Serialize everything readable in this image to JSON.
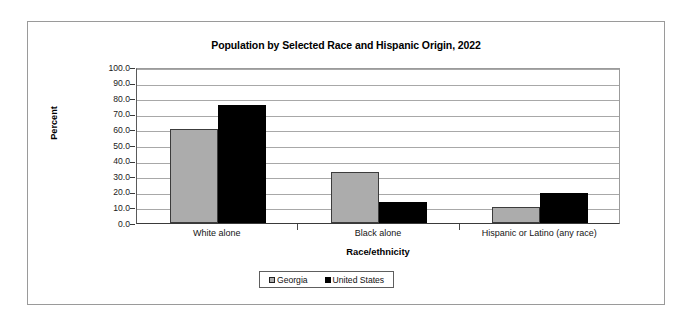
{
  "chart_data": {
    "type": "bar",
    "title": "Population by Selected Race and Hispanic Origin, 2022",
    "xlabel": "Race/ethnicity",
    "ylabel": "Percent",
    "categories": [
      "White alone",
      "Black alone",
      "Hispanic or Latino (any race)"
    ],
    "series": [
      {
        "name": "Georgia",
        "color": "#acacac",
        "values": [
          60.5,
          33.0,
          10.5
        ]
      },
      {
        "name": "United States",
        "color": "#000000",
        "values": [
          75.5,
          13.6,
          19.1
        ]
      }
    ],
    "ylim": [
      0,
      100
    ],
    "ytick_labels": [
      "100.0",
      "90.0",
      "80.0",
      "70.0",
      "60.0",
      "50.0",
      "40.0",
      "30.0",
      "20.0",
      "10.0",
      "0.0"
    ],
    "ytick_values": [
      100,
      90,
      80,
      70,
      60,
      50,
      40,
      30,
      20,
      10,
      0
    ],
    "grid": true,
    "legend_position": "bottom"
  },
  "colors": {
    "frame_border": "#9a9a9a",
    "gridline": "#a8a8a8",
    "axis": "#3a3a3a",
    "text": "#000000"
  }
}
